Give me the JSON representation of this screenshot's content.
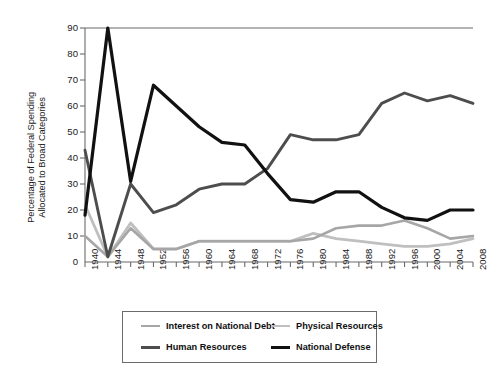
{
  "chart_data": {
    "type": "line",
    "title": "",
    "xlabel": "",
    "ylabel": "Percentage of Federal Spending\nAllocated to Broad Categories",
    "ylim": [
      0,
      90
    ],
    "yticks": [
      0,
      10,
      20,
      30,
      40,
      50,
      60,
      70,
      80,
      90
    ],
    "grid": false,
    "legend_position": "bottom",
    "categories": [
      1940,
      1944,
      1948,
      1952,
      1956,
      1960,
      1964,
      1968,
      1972,
      1976,
      1980,
      1984,
      1988,
      1992,
      1996,
      2000,
      2004,
      2008
    ],
    "xtick_labels": [
      "1940",
      "1944",
      "1948",
      "1952",
      "1956",
      "1960",
      "1964",
      "1968",
      "1972",
      "1976",
      "1980",
      "1984",
      "1988",
      "1992",
      "1996",
      "2000",
      "2004",
      "2008"
    ],
    "series": [
      {
        "name": "National Defense",
        "color": "#111111",
        "values": [
          18,
          90,
          31,
          68,
          60,
          52,
          46,
          45,
          34,
          24,
          23,
          27,
          27,
          21,
          17,
          16,
          20,
          20
        ]
      },
      {
        "name": "Human Resources",
        "color": "#4d4d4d",
        "values": [
          43,
          2,
          30,
          19,
          22,
          28,
          30,
          30,
          36,
          49,
          47,
          47,
          49,
          61,
          65,
          62,
          64,
          61
        ]
      },
      {
        "name": "Physical Resources",
        "color": "#bfbfbf",
        "values": [
          22,
          2,
          15,
          5,
          5,
          8,
          8,
          8,
          8,
          8,
          11,
          9,
          8,
          7,
          6,
          6,
          7,
          9
        ]
      },
      {
        "name": "Interest on National Debt",
        "color": "#a6a6a6",
        "values": [
          10,
          2,
          13,
          5,
          5,
          8,
          8,
          8,
          8,
          8,
          9,
          13,
          14,
          14,
          16,
          13,
          9,
          10
        ]
      }
    ]
  },
  "legend": {
    "items": [
      {
        "label": "Interest on National Debt",
        "color": "#a6a6a6",
        "thickness": 2.4
      },
      {
        "label": "Physical Resources",
        "color": "#bfbfbf",
        "thickness": 2.4
      },
      {
        "label": "Human Resources",
        "color": "#4d4d4d",
        "thickness": 3.0
      },
      {
        "label": "National Defense",
        "color": "#111111",
        "thickness": 3.2
      }
    ]
  },
  "axes": {
    "axis_color": "#6b6b6b"
  }
}
